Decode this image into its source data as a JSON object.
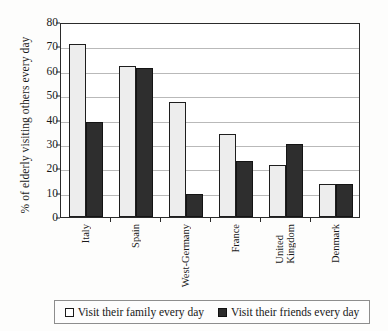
{
  "chart_data": {
    "type": "bar",
    "title": "",
    "xlabel": "",
    "ylabel": "% of elderly visiting others every day",
    "ylim": [
      0,
      80
    ],
    "yticks": [
      0,
      10,
      20,
      30,
      40,
      50,
      60,
      70,
      80
    ],
    "grid": true,
    "legend_position": "bottom",
    "categories": [
      "Italy",
      "Spain",
      "West-Germany",
      "France",
      "United Kingdom",
      "Denmark"
    ],
    "category_lines": [
      [
        "Italy"
      ],
      [
        "Spain"
      ],
      [
        "West-Germany"
      ],
      [
        "France"
      ],
      [
        "United",
        "Kingdom"
      ],
      [
        "Denmark"
      ]
    ],
    "series": [
      {
        "name": "Visit their family every day",
        "color": "#ededed",
        "values": [
          71,
          62,
          47,
          34,
          21.5,
          13.5
        ]
      },
      {
        "name": "Visit their friends every day",
        "color": "#2e2e2e",
        "values": [
          39,
          61,
          9.5,
          23,
          30,
          13.5
        ]
      }
    ]
  },
  "legend": {
    "items": [
      {
        "label": "Visit their family every day",
        "swatch": "family-swatch"
      },
      {
        "label": "Visit their friends every day",
        "swatch": "friends-swatch"
      }
    ]
  },
  "colors": {
    "frame": "#2b2b2b",
    "gridline": "#b9b9b9",
    "bar_family": "#ededed",
    "bar_friends": "#2e2e2e",
    "text": "#191919",
    "background": "#fdfdfc"
  }
}
